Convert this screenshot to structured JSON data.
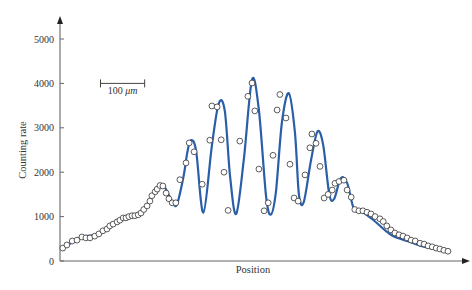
{
  "chart_data": {
    "type": "scatter",
    "title": "",
    "xlabel": "Position",
    "ylabel": "Counting rate",
    "xlim": [
      0,
      100
    ],
    "ylim": [
      0,
      5000
    ],
    "x_ticks_shown": false,
    "y_ticks": [
      0,
      1000,
      2000,
      3000,
      4000,
      5000
    ],
    "y_tick_labels": [
      "0",
      "1000",
      "2000",
      "3000",
      "4000",
      "5000"
    ],
    "grid": false,
    "legend": "none",
    "annotations": [
      {
        "type": "scale-bar",
        "label_prefix": "100 ",
        "label_unit": "μm",
        "length_units": 10.9,
        "anchor": [
          10,
          4000
        ]
      }
    ],
    "colors": {
      "fit_line": "#2a5ea8",
      "marker_edge": "#333333",
      "marker_fill": "#ffffff",
      "axis": "#666666"
    },
    "series": [
      {
        "name": "Measured counts",
        "kind": "scatter",
        "x": [
          0.7,
          1.7,
          3.0,
          4.2,
          5.4,
          6.4,
          7.4,
          8.6,
          9.6,
          10.6,
          11.6,
          12.3,
          13.1,
          14.1,
          14.8,
          15.6,
          16.3,
          17.0,
          17.8,
          18.5,
          19.3,
          20.0,
          20.7,
          21.5,
          22.2,
          22.7,
          23.5,
          24.0,
          24.7,
          25.4,
          26.2,
          26.9,
          27.7,
          28.6,
          29.6,
          31.1,
          31.9,
          33.1,
          35.1,
          37.0,
          37.5,
          38.8,
          39.8,
          40.5,
          41.5,
          44.4,
          46.4,
          47.4,
          48.1,
          49.1,
          50.4,
          51.4,
          52.6,
          53.6,
          54.3,
          55.8,
          56.8,
          57.8,
          58.8,
          60.5,
          61.7,
          62.2,
          63.2,
          64.2,
          65.2,
          66.2,
          67.2,
          67.9,
          68.9,
          70.1,
          70.9,
          71.9,
          72.8,
          73.8,
          74.8,
          75.8,
          76.8,
          77.8,
          79.0,
          79.8,
          80.7,
          81.7,
          82.7,
          83.7,
          84.7,
          85.7,
          86.7,
          87.7,
          88.9,
          89.9,
          90.9,
          91.9,
          92.9,
          93.8,
          94.8,
          95.8
        ],
        "y": [
          290,
          360,
          450,
          470,
          540,
          520,
          520,
          560,
          610,
          680,
          720,
          790,
          830,
          880,
          920,
          970,
          970,
          1000,
          1020,
          1020,
          1040,
          1080,
          1160,
          1240,
          1350,
          1470,
          1560,
          1620,
          1700,
          1690,
          1530,
          1400,
          1310,
          1310,
          1830,
          2210,
          2660,
          2460,
          1730,
          2720,
          3490,
          3470,
          2730,
          2000,
          1140,
          2700,
          3710,
          4010,
          3380,
          2070,
          1130,
          1310,
          2380,
          3400,
          3750,
          3220,
          2180,
          1420,
          1350,
          1940,
          2550,
          2860,
          2650,
          2130,
          1420,
          1500,
          1600,
          1750,
          1790,
          1820,
          1600,
          1440,
          1160,
          1130,
          1130,
          1100,
          1060,
          1000,
          950,
          890,
          790,
          700,
          630,
          590,
          560,
          520,
          470,
          450,
          400,
          380,
          340,
          320,
          290,
          270,
          240,
          220
        ]
      },
      {
        "name": "Fit",
        "kind": "line",
        "x": [
          0.7,
          5.4,
          9.6,
          14.1,
          17.8,
          20.7,
          23.5,
          25.4,
          27.7,
          28.9,
          30.5,
          31.4,
          32.3,
          33.6,
          35.4,
          37.5,
          39.2,
          40.7,
          42.0,
          43.5,
          45.4,
          47.4,
          49.1,
          50.9,
          52.1,
          53.3,
          54.8,
          56.5,
          58.0,
          59.0,
          60.2,
          62.0,
          63.6,
          65.0,
          66.5,
          67.7,
          69.3,
          70.9,
          72.6,
          74.8,
          77.8,
          81.7,
          85.7,
          89.9,
          93.8,
          95.8
        ],
        "y": [
          290,
          540,
          610,
          880,
          1020,
          1160,
          1560,
          1720,
          1330,
          1280,
          1900,
          2430,
          2720,
          2480,
          1090,
          2600,
          3550,
          3380,
          1900,
          1060,
          2300,
          4080,
          3400,
          1450,
          1050,
          1550,
          3120,
          3780,
          2900,
          1500,
          1330,
          2280,
          2920,
          2600,
          1500,
          1400,
          1860,
          1760,
          1170,
          1100,
          890,
          590,
          450,
          320,
          240,
          210
        ]
      }
    ]
  }
}
